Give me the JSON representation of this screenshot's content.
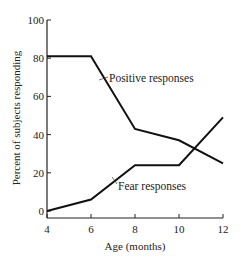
{
  "chart_data": {
    "type": "line",
    "title": "",
    "xlabel": "Age (months)",
    "ylabel": "Percent of subjects responding",
    "x": [
      4,
      6,
      8,
      10,
      12
    ],
    "xticks": [
      4,
      6,
      8,
      10,
      12
    ],
    "yticks": [
      0,
      20,
      40,
      60,
      80,
      100
    ],
    "xlim": [
      4,
      12
    ],
    "ylim": [
      0,
      100
    ],
    "grid": false,
    "legend": "inline labels",
    "series": [
      {
        "name": "Positive responses",
        "values": [
          81,
          81,
          43,
          37,
          25
        ]
      },
      {
        "name": "Fear responses",
        "values": [
          0,
          6,
          24,
          24,
          49
        ]
      }
    ]
  },
  "labels": {
    "positive": "Positive responses",
    "fear": "Fear responses",
    "xlabel": "Age (months)",
    "ylabel": "Percent of subjects responding"
  }
}
